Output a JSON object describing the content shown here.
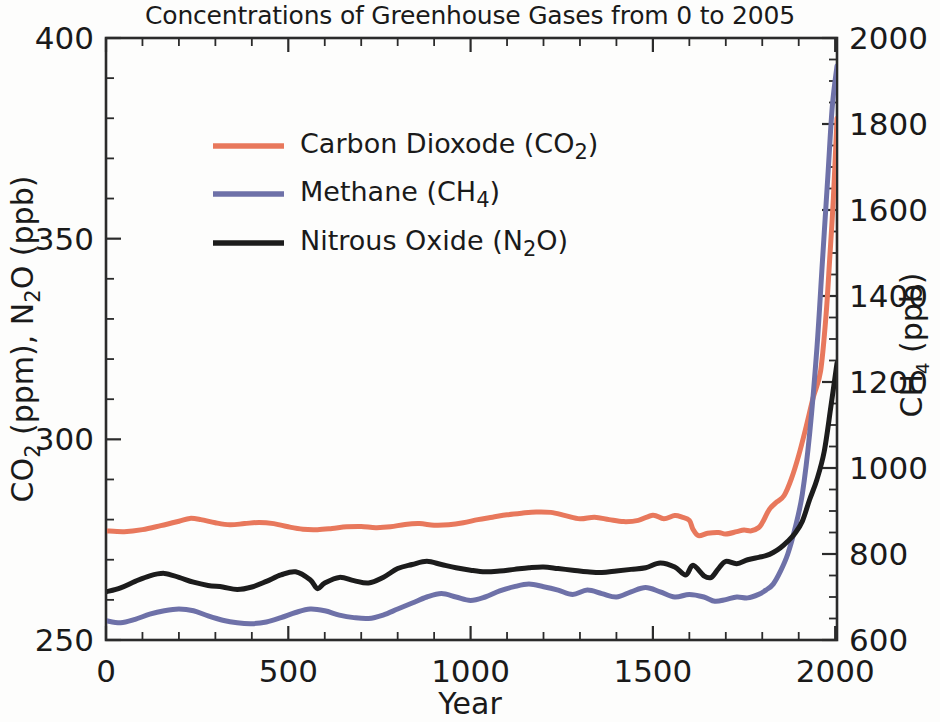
{
  "chart_data": {
    "type": "line",
    "title": "Concentrations of Greenhouse Gases from 0 to 2005",
    "xlabel": "Year",
    "ylabel_left": "CO₂ (ppm), N₂O (ppb)",
    "ylabel_right": "CH₄ (ppb)",
    "xlim": [
      0,
      2005
    ],
    "ylim_left": [
      250,
      400
    ],
    "ylim_right": [
      600,
      2000
    ],
    "xticks": [
      0,
      500,
      1000,
      1500,
      2000
    ],
    "xtick_labels": [
      "0",
      "500",
      "1000",
      "1500",
      "2000"
    ],
    "x_minor_step": 100,
    "yticks_left": [
      250,
      300,
      350,
      400
    ],
    "ytick_labels_left": [
      "250",
      "300",
      "350",
      "400"
    ],
    "y_minor_step_left": 10,
    "yticks_right": [
      600,
      800,
      1000,
      1200,
      1400,
      1600,
      1800,
      2000
    ],
    "ytick_labels_right": [
      "600",
      "800",
      "1000",
      "1200",
      "1400",
      "1600",
      "1800",
      "2000"
    ],
    "y_minor_step_right": 50,
    "grid": false,
    "legend_position": "upper-left-inside",
    "series": [
      {
        "name": "Carbon Dioxode (CO₂)",
        "legend_label_main": "Carbon Dioxode (CO",
        "legend_label_sub": "2",
        "legend_label_tail": ")",
        "color": "#E8785C",
        "axis": "left",
        "unit": "ppm",
        "x": [
          0,
          50,
          100,
          150,
          200,
          230,
          260,
          300,
          340,
          380,
          420,
          460,
          500,
          540,
          580,
          620,
          660,
          700,
          740,
          780,
          820,
          860,
          900,
          940,
          980,
          1020,
          1060,
          1100,
          1140,
          1180,
          1220,
          1260,
          1300,
          1340,
          1380,
          1420,
          1460,
          1500,
          1530,
          1560,
          1580,
          1600,
          1610,
          1625,
          1650,
          1680,
          1700,
          1730,
          1750,
          1770,
          1790,
          1800,
          1820,
          1840,
          1860,
          1880,
          1900,
          1920,
          1940,
          1960,
          1975,
          1985,
          1995,
          2005
        ],
        "y": [
          277.2,
          277.0,
          277.5,
          278.5,
          279.6,
          280.3,
          280.0,
          279.2,
          278.7,
          279.0,
          279.3,
          279.0,
          278.2,
          277.6,
          277.5,
          277.8,
          278.2,
          278.3,
          278.0,
          278.2,
          278.8,
          279.0,
          278.6,
          278.7,
          279.2,
          280.0,
          280.6,
          281.2,
          281.6,
          281.9,
          281.8,
          281.0,
          280.2,
          280.6,
          280.0,
          279.5,
          279.8,
          281.1,
          280.2,
          281.0,
          280.6,
          279.8,
          277.6,
          276.0,
          276.6,
          276.8,
          276.4,
          277.0,
          277.4,
          277.2,
          278.0,
          279.2,
          282.6,
          284.4,
          286.0,
          290.2,
          296.0,
          303.0,
          310.5,
          317.0,
          331.0,
          345.0,
          360.0,
          380.0
        ]
      },
      {
        "name": "Methane (CH₄)",
        "legend_label_main": "Methane (CH",
        "legend_label_sub": "4",
        "legend_label_tail": ")",
        "color": "#6E71A8",
        "axis": "right",
        "unit": "ppb",
        "x": [
          0,
          40,
          80,
          120,
          160,
          200,
          240,
          280,
          320,
          360,
          400,
          440,
          480,
          520,
          560,
          600,
          640,
          680,
          720,
          760,
          800,
          840,
          880,
          920,
          960,
          1000,
          1040,
          1080,
          1120,
          1160,
          1200,
          1240,
          1280,
          1320,
          1360,
          1400,
          1440,
          1480,
          1520,
          1560,
          1600,
          1640,
          1670,
          1700,
          1730,
          1760,
          1790,
          1810,
          1830,
          1850,
          1870,
          1890,
          1910,
          1930,
          1950,
          1965,
          1980,
          1992,
          2005
        ],
        "y": [
          645,
          640,
          648,
          660,
          668,
          672,
          668,
          656,
          646,
          640,
          638,
          642,
          652,
          664,
          672,
          668,
          658,
          652,
          650,
          658,
          672,
          686,
          700,
          708,
          700,
          692,
          700,
          714,
          724,
          730,
          724,
          716,
          706,
          716,
          708,
          700,
          712,
          722,
          712,
          700,
          706,
          700,
          690,
          694,
          700,
          698,
          706,
          716,
          730,
          760,
          800,
          860,
          940,
          1080,
          1280,
          1480,
          1680,
          1840,
          1935
        ]
      },
      {
        "name": "Nitrous Oxide (N₂O)",
        "legend_label_main": "Nitrous Oxide (N",
        "legend_label_sub": "2",
        "legend_label_tail": "O)",
        "color": "#1c1c1c",
        "axis": "left",
        "unit": "ppb",
        "x": [
          0,
          40,
          80,
          120,
          160,
          200,
          240,
          280,
          320,
          360,
          400,
          440,
          480,
          520,
          560,
          580,
          600,
          640,
          680,
          720,
          760,
          800,
          840,
          880,
          920,
          960,
          1000,
          1040,
          1080,
          1120,
          1160,
          1200,
          1240,
          1280,
          1320,
          1360,
          1400,
          1440,
          1480,
          1520,
          1560,
          1590,
          1610,
          1640,
          1660,
          1680,
          1700,
          1730,
          1760,
          1790,
          1810,
          1830,
          1850,
          1870,
          1890,
          1910,
          1930,
          1950,
          1970,
          1988,
          2005
        ],
        "y": [
          262.0,
          263.0,
          264.6,
          266.0,
          266.6,
          265.6,
          264.4,
          263.6,
          263.2,
          262.6,
          263.2,
          264.6,
          266.2,
          267.0,
          265.0,
          262.8,
          264.2,
          265.6,
          264.8,
          264.2,
          265.6,
          267.8,
          268.8,
          269.6,
          268.8,
          268.0,
          267.4,
          267.0,
          267.2,
          267.6,
          268.0,
          268.2,
          267.8,
          267.4,
          267.0,
          266.8,
          267.2,
          267.6,
          268.0,
          269.2,
          268.2,
          266.2,
          268.6,
          266.0,
          265.6,
          267.8,
          269.6,
          269.0,
          270.0,
          270.6,
          271.0,
          271.8,
          273.0,
          274.6,
          276.6,
          279.6,
          285.0,
          290.0,
          297.0,
          308.0,
          319.0
        ]
      }
    ]
  },
  "axes_geometry": {
    "left_px": 106,
    "right_px": 837,
    "top_px": 38,
    "bottom_px": 640
  }
}
